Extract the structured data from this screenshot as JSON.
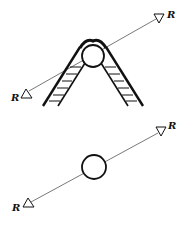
{
  "figure": {
    "top_diagram": {
      "description": "Ray passing a circle resting atop an A-frame ladder",
      "label_upper_right": "R",
      "label_lower_left": "R"
    },
    "bottom_diagram": {
      "description": "Ray passing a free circle",
      "label_upper_right": "R",
      "label_lower_left": "R"
    }
  },
  "colors": {
    "stroke": "#111111",
    "ray": "#555555",
    "background": "#ffffff"
  }
}
